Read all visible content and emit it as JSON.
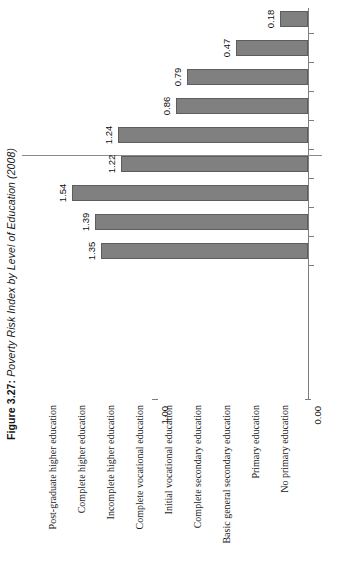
{
  "figure": {
    "label": "Figure 3.27:",
    "title": "Poverty Risk Index by Level of Education (2008)"
  },
  "axis": {
    "ticks": [
      {
        "label": "1.00",
        "value": 1.0
      },
      {
        "label": "0.00",
        "value": 0.0
      }
    ],
    "gridline_value": "1.00",
    "baseline_value": "0.00"
  },
  "colors": {
    "bar_fill": "#808080",
    "bar_border": "#5d5d5d",
    "axis": "#7d7d7d",
    "background": "#ffffff",
    "text": "#111111"
  },
  "chart_data": {
    "type": "bar",
    "orientation": "rotated-vertical",
    "title": "Poverty Risk Index by Level of Education (2008)",
    "xlabel": "",
    "ylabel": "",
    "ylim": [
      0.0,
      1.6
    ],
    "grid": true,
    "gridlines": [
      1.0
    ],
    "legend": null,
    "categories": [
      "Post-graduate higher education",
      "Complete higher education",
      "Incomplete higher education",
      "Complete vocational education",
      "Initial vocational education",
      "Complete secondary education",
      "Basic general secondary education",
      "Primary education",
      "No primary education"
    ],
    "values": [
      0.18,
      0.47,
      0.79,
      0.86,
      1.24,
      1.22,
      1.54,
      1.39,
      1.35
    ],
    "value_labels": [
      "0.18",
      "0.47",
      "0.79",
      "0.86",
      "1.24",
      "1.22",
      "1.54",
      "1.39",
      "1.35"
    ],
    "tick_labels": [
      "0.00",
      "1.00"
    ]
  }
}
